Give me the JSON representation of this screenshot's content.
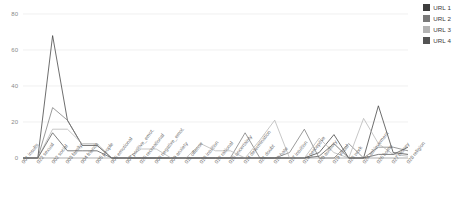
{
  "chart_data": {
    "type": "line",
    "title": "",
    "xlabel": "",
    "ylabel": "",
    "ylim": [
      0,
      80
    ],
    "yticks": [
      0,
      20,
      40,
      60,
      80
    ],
    "grid": true,
    "legend_position": "top-right",
    "categories": [
      "001 insults",
      "022 sexual",
      "002 social",
      "003 family",
      "004 friends",
      "005 people",
      "006 emotional",
      "007 positive_emot.",
      "025 recreational",
      "008 negative_emot.",
      "009 anxiety",
      "011 offense",
      "013 intuition",
      "012 rational",
      "015 uncertainty",
      "014 determination",
      "021 doubt",
      "016 hate",
      "017 intuition",
      "018 perceptive",
      "020 auditory",
      "019 visual",
      "023 work",
      "024 achievement",
      "026 home",
      "027 money",
      "028 religion"
    ],
    "series": [
      {
        "name": "URL 1",
        "color": "#3d3d3d",
        "values": [
          0,
          0,
          68,
          21,
          7,
          7,
          0,
          0,
          0,
          0,
          0,
          0,
          0,
          0,
          0,
          0,
          0,
          0,
          0,
          0,
          3,
          13,
          0,
          0,
          29,
          3,
          2
        ]
      },
      {
        "name": "URL 2",
        "color": "#7a7a7a",
        "values": [
          0,
          0,
          28,
          21,
          7,
          7,
          0,
          0,
          0,
          0,
          0,
          0,
          0,
          0,
          0,
          14,
          0,
          0,
          3,
          16,
          0,
          0,
          8,
          0,
          6,
          6,
          4
        ]
      },
      {
        "name": "URL 3",
        "color": "#b4b4b4",
        "values": [
          0,
          0,
          16,
          16,
          8,
          8,
          0,
          0,
          5,
          5,
          0,
          0,
          8,
          4,
          4,
          0,
          10,
          21,
          0,
          0,
          11,
          3,
          0,
          22,
          8,
          2,
          1
        ]
      },
      {
        "name": "URL 4",
        "color": "#545454",
        "values": [
          0,
          0,
          14,
          4,
          4,
          4,
          0,
          0,
          0,
          0,
          0,
          0,
          0,
          0,
          0,
          0,
          0,
          0,
          0,
          0,
          1,
          8,
          0,
          0,
          2,
          2,
          6
        ]
      }
    ]
  },
  "axis": {
    "y_labels": [
      "80",
      "60",
      "40",
      "20",
      "0"
    ]
  },
  "legend": {
    "items": [
      {
        "label": "URL 1",
        "color": "#3d3d3d"
      },
      {
        "label": "URL 2",
        "color": "#7a7a7a"
      },
      {
        "label": "URL 3",
        "color": "#b4b4b4"
      },
      {
        "label": "URL 4",
        "color": "#545454"
      }
    ]
  }
}
